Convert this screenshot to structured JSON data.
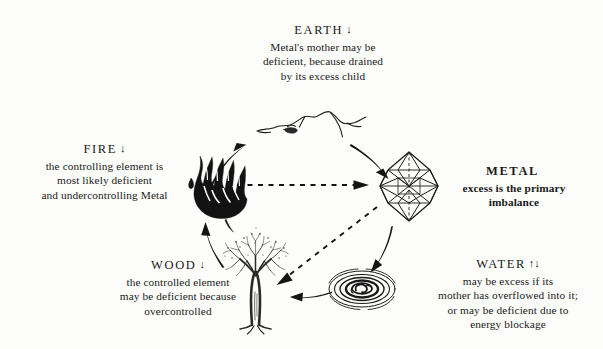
{
  "diagram": {
    "ink_color": "#1a1a1a",
    "background_color": "#fdfdfb"
  },
  "elements": {
    "earth": {
      "name": "EARTH",
      "arrows": "↓",
      "arrow_meaning": "deficient",
      "lines": [
        "Metal's mother may be",
        "deficient, because drained",
        "by its excess child"
      ],
      "icon": "mountain-icon",
      "emphasis": "normal"
    },
    "fire": {
      "name": "FIRE",
      "arrows": "↓",
      "arrow_meaning": "deficient",
      "lines": [
        "the controlling element is",
        "most likely deficient",
        "and undercontrolling Metal"
      ],
      "icon": "flame-icon",
      "emphasis": "normal"
    },
    "metal": {
      "name": "METAL",
      "arrows": "",
      "arrow_meaning": "excess",
      "lines": [
        "excess is the primary",
        "imbalance"
      ],
      "icon": "crystal-icon",
      "emphasis": "bold"
    },
    "water": {
      "name": "WATER",
      "arrows": "↑↓",
      "arrow_meaning": "excess or deficient",
      "lines": [
        "may be excess if its",
        "mother has overflowed into it;",
        "or may be deficient due to",
        "energy blockage"
      ],
      "icon": "ripple-icon",
      "emphasis": "normal"
    },
    "wood": {
      "name": "WOOD",
      "arrows": "↓",
      "arrow_meaning": "deficient",
      "lines": [
        "the controlled element",
        "may be deficient because",
        "overcontrolled"
      ],
      "icon": "tree-icon",
      "emphasis": "normal"
    }
  },
  "connections": {
    "generating_cycle": [
      {
        "from": "wood",
        "to": "fire",
        "style": "solid"
      },
      {
        "from": "fire",
        "to": "earth",
        "style": "solid"
      },
      {
        "from": "earth",
        "to": "metal",
        "style": "solid"
      },
      {
        "from": "metal",
        "to": "water",
        "style": "solid"
      },
      {
        "from": "water",
        "to": "wood",
        "style": "solid"
      }
    ],
    "controlling_cycle": [
      {
        "from": "fire",
        "to": "metal",
        "style": "dashed"
      },
      {
        "from": "metal",
        "to": "wood",
        "style": "dashed"
      }
    ]
  }
}
